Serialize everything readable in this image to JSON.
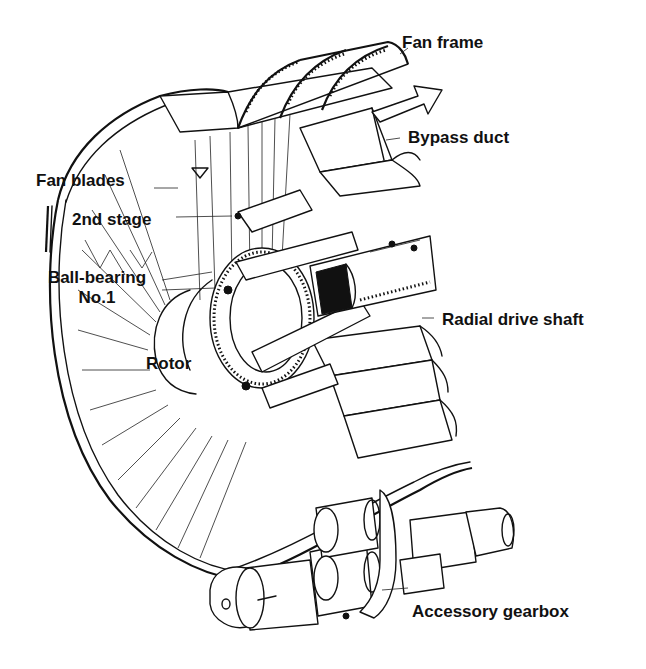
{
  "diagram": {
    "labels": {
      "fan_frame": "Fan frame",
      "bypass_duct": "Bypass duct",
      "fan_blades": "Fan blades",
      "second_stage": "2nd stage",
      "ball_bearing_line1": "Ball-bearing",
      "ball_bearing_line2": "No.1",
      "radial_drive_shaft": "Radial drive shaft",
      "rotor": "Rotor",
      "accessory_gearbox": "Accessory gearbox"
    },
    "flow_arrow": "airflow-direction-arrow",
    "colors": {
      "line": "#111111",
      "background": "#ffffff"
    }
  }
}
